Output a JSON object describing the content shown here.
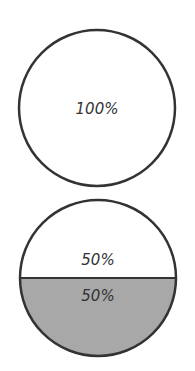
{
  "diagram": {
    "circles": [
      {
        "id": "full",
        "segments": [
          {
            "label": "100%",
            "fill": "#ffffff"
          }
        ]
      },
      {
        "id": "half",
        "segments": [
          {
            "label": "50%",
            "fill": "#ffffff",
            "position": "top"
          },
          {
            "label": "50%",
            "fill": "#a8a8a8",
            "position": "bottom"
          }
        ]
      }
    ],
    "stroke_color": "#333333"
  }
}
